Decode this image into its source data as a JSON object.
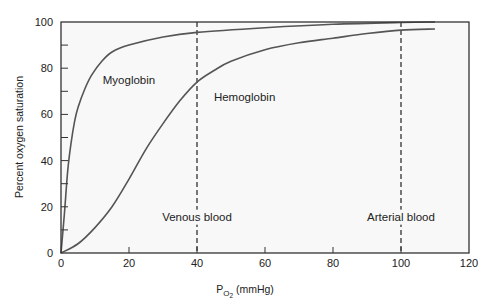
{
  "chart_data": {
    "type": "line",
    "title": "",
    "xlabel": "P_O2 (mmHg)",
    "xlabel_parts": {
      "main": "P",
      "sub": "O",
      "subsub": "2",
      "units": " (mmHg)"
    },
    "ylabel": "Percent oxygen saturation",
    "xlim": [
      0,
      120
    ],
    "ylim": [
      0,
      100
    ],
    "x_ticks": [
      0,
      20,
      40,
      60,
      80,
      100,
      120
    ],
    "y_ticks": [
      0,
      20,
      40,
      60,
      80,
      100
    ],
    "y_minor_ticks": [
      10,
      30,
      50,
      70,
      90
    ],
    "grid": false,
    "legend": null,
    "series": [
      {
        "name": "Myoglobin",
        "color": "#555555",
        "x": [
          0,
          1,
          2,
          3,
          4,
          5,
          7,
          9,
          12,
          15,
          20,
          30,
          40,
          60,
          80,
          100,
          110
        ],
        "y": [
          0,
          17,
          36,
          48,
          57,
          63,
          71,
          77,
          83,
          87,
          90,
          93.5,
          95.5,
          97.5,
          99,
          99.8,
          100
        ]
      },
      {
        "name": "Hemoglobin",
        "color": "#555555",
        "x": [
          0,
          5,
          10,
          15,
          20,
          25,
          30,
          35,
          40,
          45,
          50,
          60,
          70,
          80,
          90,
          100,
          110
        ],
        "y": [
          0,
          4,
          11,
          20,
          32,
          45,
          56,
          66,
          74,
          79,
          83,
          88,
          91,
          93,
          95,
          96.5,
          97
        ]
      }
    ],
    "reference_lines": [
      {
        "x": 40,
        "label": "Venous blood",
        "style": "dashed"
      },
      {
        "x": 100,
        "label": "Arterial blood",
        "style": "dashed"
      }
    ],
    "annotations": [
      {
        "text": "Myoglobin",
        "x": 20,
        "y": 73
      },
      {
        "text": "Hemoglobin",
        "x": 54,
        "y": 66
      },
      {
        "text": "Venous blood",
        "x": 40,
        "y": 14
      },
      {
        "text": "Arterial blood",
        "x": 100,
        "y": 14
      }
    ]
  },
  "colors": {
    "plot_background": "#f8f8f8",
    "axis": "#333333",
    "curve": "#555555"
  }
}
